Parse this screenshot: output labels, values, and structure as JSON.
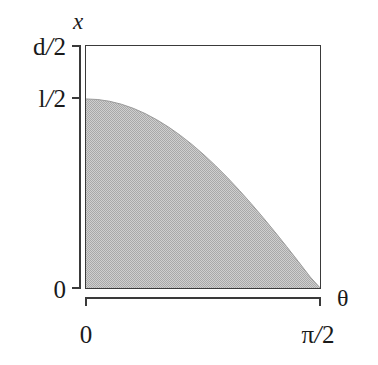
{
  "figure": {
    "kind": "mathematical-plot",
    "axis_title_x": "x",
    "axis_title_theta": "θ",
    "y_ticks": [
      {
        "label": "d/2",
        "num": "d",
        "den": "2",
        "value": 1.0
      },
      {
        "label": "l/2",
        "num": "l",
        "den": "2",
        "value": 0.783
      },
      {
        "label": "0",
        "num": "0",
        "den": "",
        "value": 0.0
      }
    ],
    "x_ticks": [
      {
        "label": "0",
        "num": "0",
        "den": "",
        "value": 0.0
      },
      {
        "label": "π/2",
        "num": "π",
        "den": "2",
        "value": 1.5708
      }
    ],
    "colors": {
      "line": "#3a3a3a",
      "fill": "#bdbdbd",
      "fill_dark": "#a9a9a9",
      "background": "#ffffff"
    }
  },
  "chart_data": {
    "type": "area",
    "title": "",
    "subtitle": "",
    "xlabel": "θ",
    "ylabel": "x",
    "xlim": [
      0,
      1.5708
    ],
    "ylim": [
      0,
      1.0
    ],
    "xtick_values": [
      0,
      1.5708
    ],
    "xtick_labels": [
      "0",
      "π/2"
    ],
    "ytick_values": [
      0,
      0.783,
      1.0
    ],
    "ytick_labels": [
      "0",
      "l/2",
      "d/2"
    ],
    "grid": false,
    "legend": null,
    "series": [
      {
        "name": "x = (l/2) cos(θ)",
        "fill_below": true,
        "x": [
          0.0,
          0.0785,
          0.1571,
          0.2356,
          0.3142,
          0.3927,
          0.4712,
          0.5498,
          0.6283,
          0.7069,
          0.7854,
          0.8639,
          0.9425,
          1.021,
          1.0996,
          1.1781,
          1.2566,
          1.3352,
          1.4137,
          1.4923,
          1.5708
        ],
        "y": [
          0.783,
          0.7806,
          0.7734,
          0.7614,
          0.7447,
          0.7234,
          0.6977,
          0.6677,
          0.6336,
          0.5956,
          0.5537,
          0.5084,
          0.4598,
          0.4082,
          0.3539,
          0.2973,
          0.2385,
          0.1781,
          0.1163,
          0.0534,
          0.0
        ]
      }
    ],
    "annotations": []
  }
}
